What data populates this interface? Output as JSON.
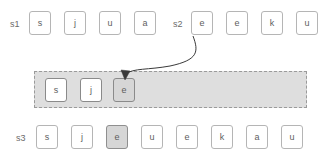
{
  "diagram": {
    "type": "sequence-merge-diagram",
    "colors": {
      "cell_border": "#b5b5b5",
      "cell_border_dark": "#8a8a8a",
      "cell_fill": "#ffffff",
      "highlight_fill": "#d6d6d6",
      "highlight_border": "#8f8f8f",
      "container_fill": "#dedede",
      "container_border": "#9a9a9a",
      "text": "#5e5e5e",
      "label_text": "#6b6b6b",
      "arrow": "#3a3a3a",
      "background": "#ffffff"
    },
    "rows": [
      {
        "id": "s1",
        "label": "s1",
        "label_x": 10,
        "label_y": 20,
        "cells": [
          {
            "text": "s",
            "x": 29,
            "y": 11,
            "highlight": false
          },
          {
            "text": "j",
            "x": 64,
            "y": 11,
            "highlight": false
          },
          {
            "text": "u",
            "x": 99,
            "y": 11,
            "highlight": false
          },
          {
            "text": "a",
            "x": 134,
            "y": 11,
            "highlight": false
          }
        ]
      },
      {
        "id": "s2",
        "label": "s2",
        "label_x": 173,
        "label_y": 20,
        "cells": [
          {
            "text": "e",
            "x": 191,
            "y": 11,
            "highlight": false
          },
          {
            "text": "e",
            "x": 226,
            "y": 11,
            "highlight": false
          },
          {
            "text": "k",
            "x": 261,
            "y": 11,
            "highlight": false
          },
          {
            "text": "u",
            "x": 296,
            "y": 11,
            "highlight": false
          }
        ]
      },
      {
        "id": "merge",
        "label": "",
        "label_x": 0,
        "label_y": 0,
        "cells": [
          {
            "text": "s",
            "x": 45,
            "y": 78,
            "highlight": false
          },
          {
            "text": "j",
            "x": 80,
            "y": 78,
            "highlight": false
          },
          {
            "text": "e",
            "x": 113,
            "y": 78,
            "highlight": true
          }
        ]
      },
      {
        "id": "s3",
        "label": "s3",
        "label_x": 16,
        "label_y": 134,
        "cells": [
          {
            "text": "s",
            "x": 36,
            "y": 125,
            "highlight": false
          },
          {
            "text": "j",
            "x": 71,
            "y": 125,
            "highlight": false
          },
          {
            "text": "e",
            "x": 106,
            "y": 125,
            "highlight": true
          },
          {
            "text": "u",
            "x": 141,
            "y": 125,
            "highlight": false
          },
          {
            "text": "e",
            "x": 176,
            "y": 125,
            "highlight": false
          },
          {
            "text": "k",
            "x": 211,
            "y": 125,
            "highlight": false
          },
          {
            "text": "a",
            "x": 246,
            "y": 125,
            "highlight": false
          },
          {
            "text": "u",
            "x": 281,
            "y": 125,
            "highlight": false
          }
        ]
      }
    ],
    "container": {
      "name": "merge-buffer",
      "x": 34,
      "y": 71,
      "width": 273,
      "height": 37
    },
    "arrow": {
      "name": "copy-arrow",
      "from_row": "s2",
      "from_cell_index": 0,
      "to_row": "merge",
      "to_cell_index": 2,
      "path": "M 193 36 C 199 52 198 60 170 66 C 148 70 134 68 125 74",
      "head": "M 125 80 L 121 70 L 130 71 Z"
    }
  }
}
